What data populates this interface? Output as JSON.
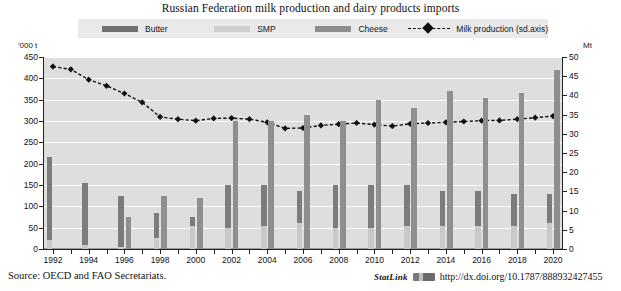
{
  "title": "Russian Federation milk production and dairy products imports",
  "legend": {
    "items": [
      {
        "label": "Butter",
        "key": "butter",
        "type": "bar",
        "color": "#7c7c7c",
        "icon": "legend-swatch-butter"
      },
      {
        "label": "SMP",
        "key": "smp",
        "type": "bar",
        "color": "#c9c9c9",
        "icon": "legend-swatch-smp"
      },
      {
        "label": "Cheese",
        "key": "cheese",
        "type": "bar",
        "color": "#8f8f8f",
        "icon": "legend-swatch-cheese"
      },
      {
        "label": "Milk production (sd.axis)",
        "key": "milk",
        "type": "line",
        "color": "#111111",
        "icon": "legend-marker-milk"
      }
    ]
  },
  "axes": {
    "left_unit": "'000 t",
    "right_unit": "Mt",
    "left_ticks": [
      0,
      50,
      100,
      150,
      200,
      250,
      300,
      350,
      400,
      450
    ],
    "right_ticks": [
      0,
      5,
      10,
      15,
      20,
      25,
      30,
      35,
      40,
      45,
      50
    ],
    "left_range": [
      0,
      450
    ],
    "right_range": [
      0,
      50
    ],
    "x_tick_labels": [
      "1992",
      "1994",
      "1996",
      "1998",
      "2000",
      "2002",
      "2004",
      "2006",
      "2008",
      "2010",
      "2012",
      "2014",
      "2016",
      "2018",
      "2020"
    ],
    "grid": true
  },
  "chart_data": {
    "type": "bar",
    "title": "Russian Federation milk production and dairy products imports",
    "xlabel": "",
    "ylabel": "'000 t",
    "y2label": "Mt",
    "ylim": [
      0,
      450
    ],
    "y2lim": [
      0,
      50
    ],
    "grid": true,
    "legend_position": "top",
    "categories": [
      "1992",
      "1993",
      "1994",
      "1995",
      "1996",
      "1997",
      "1998",
      "1999",
      "2000",
      "2001",
      "2002",
      "2003",
      "2004",
      "2005",
      "2006",
      "2007",
      "2008",
      "2009",
      "2010",
      "2011",
      "2012",
      "2013",
      "2014",
      "2015",
      "2016",
      "2017",
      "2018",
      "2019",
      "2020"
    ],
    "series": [
      {
        "name": "Butter",
        "axis": "left",
        "unit": "'000 t",
        "color": "#7c7c7c",
        "values": [
          215,
          0,
          155,
          0,
          125,
          0,
          85,
          0,
          75,
          0,
          150,
          0,
          150,
          0,
          135,
          0,
          150,
          0,
          150,
          0,
          150,
          0,
          135,
          0,
          135,
          0,
          130,
          0,
          130
        ]
      },
      {
        "name": "SMP",
        "axis": "left",
        "unit": "'000 t",
        "color": "#c9c9c9",
        "values": [
          20,
          0,
          10,
          0,
          5,
          0,
          25,
          0,
          55,
          0,
          50,
          0,
          55,
          0,
          60,
          0,
          50,
          0,
          50,
          0,
          55,
          0,
          55,
          0,
          55,
          0,
          55,
          0,
          60
        ]
      },
      {
        "name": "Cheese",
        "axis": "left",
        "unit": "'000 t",
        "color": "#8f8f8f",
        "values": [
          0,
          0,
          0,
          0,
          75,
          0,
          125,
          0,
          120,
          0,
          300,
          0,
          300,
          0,
          315,
          0,
          300,
          0,
          350,
          0,
          330,
          0,
          370,
          0,
          355,
          0,
          365,
          0,
          420
        ]
      },
      {
        "name": "Milk production (sd.axis)",
        "axis": "right",
        "unit": "Mt",
        "color": "#111111",
        "marker": "diamond",
        "linestyle": "dashed",
        "values": [
          47.5,
          46.8,
          44.1,
          42.5,
          40.5,
          38.2,
          34.4,
          33.8,
          33.4,
          34.0,
          34.1,
          33.8,
          33.0,
          31.4,
          31.5,
          32.2,
          32.5,
          32.8,
          32.4,
          32.0,
          32.6,
          32.8,
          33.0,
          33.2,
          33.4,
          33.5,
          33.8,
          34.2,
          34.6
        ]
      }
    ]
  },
  "footer": {
    "source": "Source:  OECD and FAO Secretariats.",
    "statlink_word": "StatLink",
    "statlink_url": "http://dx.doi.org/10.1787/888932427455"
  }
}
